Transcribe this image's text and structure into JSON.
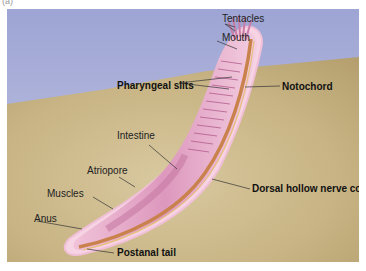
{
  "figure": {
    "panel_letter": "(a)",
    "colors": {
      "water": "#aab0d8",
      "sand": "#cbb78a",
      "body": "#e3a6c4",
      "notochord": "#c9824c"
    }
  },
  "labels": {
    "tentacles": "Tentacles",
    "mouth": "Mouth",
    "pharyngeal_slits": "Pharyngeal slits",
    "notochord": "Notochord",
    "intestine": "Intestine",
    "atriopore": "Atriopore",
    "muscles": "Muscles",
    "anus": "Anus",
    "dorsal_nerve_cord": "Dorsal hollow nerve cord",
    "postanal_tail": "Postanal tail"
  }
}
